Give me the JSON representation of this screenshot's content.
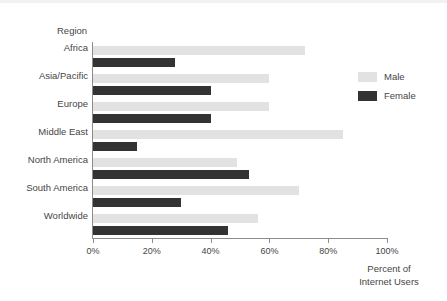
{
  "chart_data": {
    "type": "bar",
    "orientation": "horizontal",
    "title": "",
    "xlabel": "Percent of Internet Users",
    "xlabel_lines": [
      "Percent of",
      "Internet Users"
    ],
    "ylabel": "Region",
    "categories": [
      "Africa",
      "Asia/Pacific",
      "Europe",
      "Middle East",
      "North America",
      "South America",
      "Worldwide"
    ],
    "series": [
      {
        "name": "Male",
        "color": "#e2e2e2",
        "values": [
          72,
          60,
          60,
          85,
          49,
          70,
          56
        ]
      },
      {
        "name": "Female",
        "color": "#333333",
        "values": [
          28,
          40,
          40,
          15,
          53,
          30,
          46
        ]
      }
    ],
    "xlim": [
      0,
      100
    ],
    "xticks": [
      0,
      20,
      40,
      60,
      80,
      100
    ],
    "xtick_labels": [
      "0%",
      "20%",
      "40%",
      "60%",
      "80%",
      "100%"
    ],
    "grid": false,
    "legend_position": "right-top",
    "legend_entries": [
      "Male",
      "Female"
    ]
  }
}
